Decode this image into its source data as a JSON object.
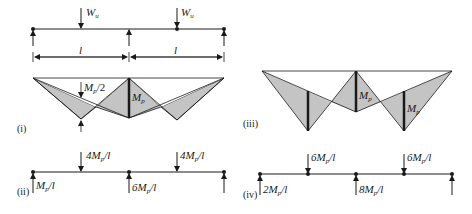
{
  "figure": {
    "beam": {
      "loads": [
        {
          "symbol": "W",
          "sub": "u"
        },
        {
          "symbol": "W",
          "sub": "u"
        }
      ],
      "span_labels": [
        "l",
        "l"
      ]
    },
    "panel_i": {
      "tag": "(i)",
      "label_half": {
        "main": "M",
        "sub": "p",
        "tail": "/2"
      },
      "label_support": {
        "main": "M",
        "sub": "p"
      }
    },
    "panel_ii": {
      "tag": "(ii)",
      "loads": [
        {
          "pre": "4M",
          "sub": "p",
          "tail": "/l"
        },
        {
          "pre": "4M",
          "sub": "p",
          "tail": "/l"
        }
      ],
      "reactions": [
        {
          "pre": "M",
          "sub": "p",
          "tail": "/l"
        },
        {
          "pre": "6M",
          "sub": "p",
          "tail": "/l"
        }
      ]
    },
    "panel_iii": {
      "tag": "(iii)",
      "labels": [
        {
          "main": "M",
          "sub": "p"
        },
        {
          "main": "M",
          "sub": "p"
        }
      ]
    },
    "panel_iv": {
      "tag": "(iv)",
      "loads": [
        {
          "pre": "6M",
          "sub": "p",
          "tail": "/l"
        },
        {
          "pre": "6M",
          "sub": "p",
          "tail": "/l"
        }
      ],
      "reactions": [
        {
          "pre": "2M",
          "sub": "p",
          "tail": "/l"
        },
        {
          "pre": "8M",
          "sub": "p",
          "tail": "/l"
        }
      ]
    },
    "colors": {
      "fill": "#c4c4c4",
      "line": "#1a1a1a"
    }
  }
}
